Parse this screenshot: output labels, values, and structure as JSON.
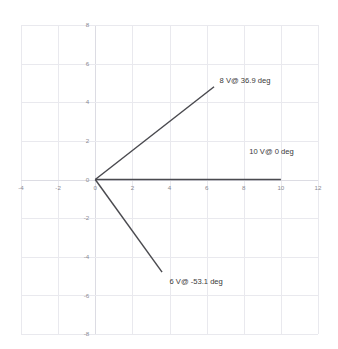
{
  "chart_data": {
    "type": "line",
    "title": "",
    "subtitle": "",
    "xlabel": "",
    "ylabel": "",
    "xlim": [
      -4,
      12
    ],
    "ylim": [
      -8,
      8
    ],
    "xticks": [
      -4,
      -2,
      0,
      2,
      4,
      6,
      8,
      10,
      12
    ],
    "xticklabels": [
      "-4",
      "-2",
      "0",
      "2",
      "4",
      "6",
      "8",
      "10",
      "12"
    ],
    "yticks": [
      8,
      6,
      4,
      2,
      0,
      -2,
      -4,
      -6,
      -8
    ],
    "yticklabels": [
      "8",
      "6",
      "4",
      "2",
      "0",
      "-2",
      "-4",
      "-6",
      "-8"
    ],
    "grid": true,
    "legend": "none",
    "series": [
      {
        "name": "8 V@ 36.9 deg",
        "magnitude": 8,
        "angle_deg": 36.9,
        "x": [
          0,
          6.4
        ],
        "y": [
          0,
          4.8
        ],
        "color": "#4a4a4f"
      },
      {
        "name": "10 V@ 0 deg",
        "magnitude": 10,
        "angle_deg": 0,
        "x": [
          0,
          10
        ],
        "y": [
          0,
          0
        ],
        "color": "#4a4a4f"
      },
      {
        "name": "6 V@ -53.1 deg",
        "magnitude": 6,
        "angle_deg": -53.1,
        "x": [
          0,
          3.6
        ],
        "y": [
          0,
          -4.8
        ],
        "color": "#4a4a4f"
      }
    ],
    "annotations": [
      {
        "text": "8 V@ 36.9 deg",
        "x": 6.7,
        "y": 5.0
      },
      {
        "text": "10 V@ 0 deg",
        "x": 8.3,
        "y": 1.3
      },
      {
        "text": "6 V@ -53.1 deg",
        "x": 4.0,
        "y": -5.4
      }
    ],
    "colors": {
      "background": "#ffffff",
      "grid": "#e9e9ee",
      "axis": "#dcdce3",
      "vector": "#4a4a4f",
      "tick_label": "#8a8a92",
      "annotation": "#3a3a3a"
    }
  }
}
